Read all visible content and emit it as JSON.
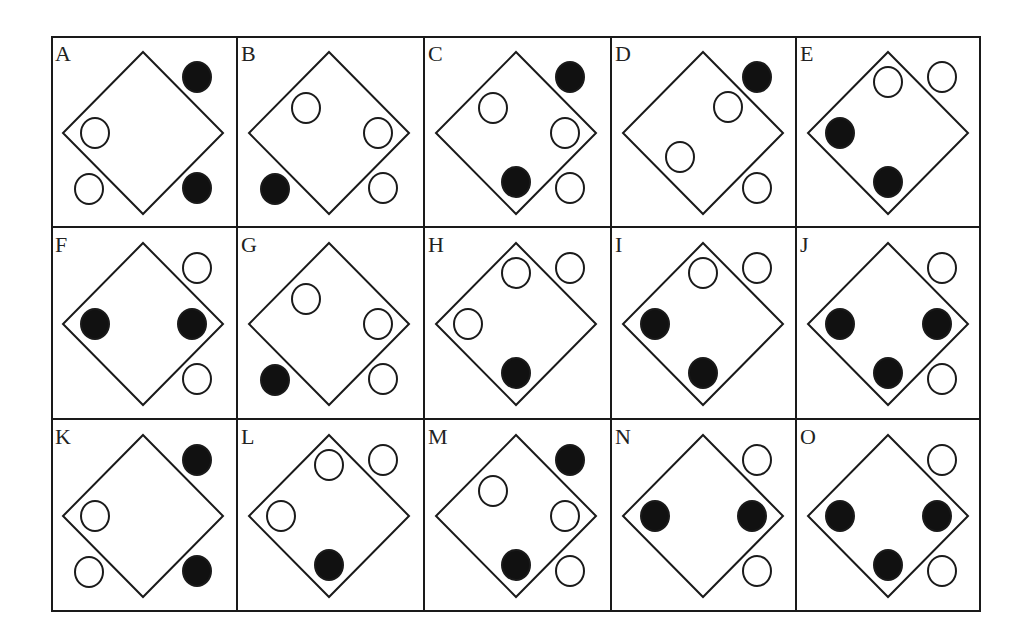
{
  "puzzle": {
    "rows": 3,
    "cols": 5,
    "colors": {
      "stroke": "#1a1a1a",
      "filled": "#111111",
      "hollow": "#ffffff",
      "background": "#ffffff"
    },
    "positions": {
      "TR": [
        146,
        41
      ],
      "BR": [
        146,
        152
      ],
      "BL": [
        38,
        153
      ],
      "L": [
        44,
        97
      ],
      "R": [
        141,
        97
      ],
      "T": [
        92,
        46
      ],
      "B": [
        92,
        146
      ],
      "UL": [
        69,
        72
      ],
      "UR": [
        117,
        71
      ],
      "LL": [
        69,
        121
      ]
    },
    "cells": [
      {
        "label": "A",
        "circles": [
          {
            "pos": "TR",
            "fill": "filled"
          },
          {
            "pos": "L",
            "fill": "hollow"
          },
          {
            "pos": "BL",
            "fill": "hollow"
          },
          {
            "pos": "BR",
            "fill": "filled"
          }
        ]
      },
      {
        "label": "B",
        "circles": [
          {
            "pos": "UL",
            "fill": "hollow"
          },
          {
            "pos": "R",
            "fill": "hollow"
          },
          {
            "pos": "BL",
            "fill": "filled"
          },
          {
            "pos": "BR",
            "fill": "hollow"
          }
        ]
      },
      {
        "label": "C",
        "circles": [
          {
            "pos": "TR",
            "fill": "filled"
          },
          {
            "pos": "UL",
            "fill": "hollow"
          },
          {
            "pos": "R",
            "fill": "hollow"
          },
          {
            "pos": "B",
            "fill": "filled"
          },
          {
            "pos": "BR",
            "fill": "hollow"
          }
        ]
      },
      {
        "label": "D",
        "circles": [
          {
            "pos": "TR",
            "fill": "filled"
          },
          {
            "pos": "UR",
            "fill": "hollow"
          },
          {
            "pos": "LL",
            "fill": "hollow"
          },
          {
            "pos": "BR",
            "fill": "hollow"
          }
        ]
      },
      {
        "label": "E",
        "circles": [
          {
            "pos": "T",
            "fill": "hollow"
          },
          {
            "pos": "TR",
            "fill": "hollow"
          },
          {
            "pos": "L",
            "fill": "filled"
          },
          {
            "pos": "B",
            "fill": "filled"
          }
        ]
      },
      {
        "label": "F",
        "circles": [
          {
            "pos": "TR",
            "fill": "hollow"
          },
          {
            "pos": "L",
            "fill": "filled"
          },
          {
            "pos": "R",
            "fill": "filled"
          },
          {
            "pos": "BR",
            "fill": "hollow"
          }
        ]
      },
      {
        "label": "G",
        "circles": [
          {
            "pos": "UL",
            "fill": "hollow"
          },
          {
            "pos": "R",
            "fill": "hollow"
          },
          {
            "pos": "BL",
            "fill": "filled"
          },
          {
            "pos": "BR",
            "fill": "hollow"
          }
        ]
      },
      {
        "label": "H",
        "circles": [
          {
            "pos": "T",
            "fill": "hollow"
          },
          {
            "pos": "TR",
            "fill": "hollow"
          },
          {
            "pos": "L",
            "fill": "hollow"
          },
          {
            "pos": "B",
            "fill": "filled"
          }
        ]
      },
      {
        "label": "I",
        "circles": [
          {
            "pos": "T",
            "fill": "hollow"
          },
          {
            "pos": "TR",
            "fill": "hollow"
          },
          {
            "pos": "L",
            "fill": "filled"
          },
          {
            "pos": "B",
            "fill": "filled"
          }
        ]
      },
      {
        "label": "J",
        "circles": [
          {
            "pos": "TR",
            "fill": "hollow"
          },
          {
            "pos": "L",
            "fill": "filled"
          },
          {
            "pos": "R",
            "fill": "filled"
          },
          {
            "pos": "B",
            "fill": "filled"
          },
          {
            "pos": "BR",
            "fill": "hollow"
          }
        ]
      },
      {
        "label": "K",
        "circles": [
          {
            "pos": "TR",
            "fill": "filled"
          },
          {
            "pos": "L",
            "fill": "hollow"
          },
          {
            "pos": "BL",
            "fill": "hollow"
          },
          {
            "pos": "BR",
            "fill": "filled"
          }
        ]
      },
      {
        "label": "L",
        "circles": [
          {
            "pos": "T",
            "fill": "hollow"
          },
          {
            "pos": "TR",
            "fill": "hollow"
          },
          {
            "pos": "L",
            "fill": "hollow"
          },
          {
            "pos": "B",
            "fill": "filled"
          }
        ]
      },
      {
        "label": "M",
        "circles": [
          {
            "pos": "TR",
            "fill": "filled"
          },
          {
            "pos": "UL",
            "fill": "hollow"
          },
          {
            "pos": "R",
            "fill": "hollow"
          },
          {
            "pos": "B",
            "fill": "filled"
          },
          {
            "pos": "BR",
            "fill": "hollow"
          }
        ]
      },
      {
        "label": "N",
        "circles": [
          {
            "pos": "TR",
            "fill": "hollow"
          },
          {
            "pos": "L",
            "fill": "filled"
          },
          {
            "pos": "R",
            "fill": "filled"
          },
          {
            "pos": "BR",
            "fill": "hollow"
          }
        ]
      },
      {
        "label": "O",
        "circles": [
          {
            "pos": "TR",
            "fill": "hollow"
          },
          {
            "pos": "L",
            "fill": "filled"
          },
          {
            "pos": "R",
            "fill": "filled"
          },
          {
            "pos": "B",
            "fill": "filled"
          },
          {
            "pos": "BR",
            "fill": "hollow"
          }
        ]
      }
    ]
  }
}
